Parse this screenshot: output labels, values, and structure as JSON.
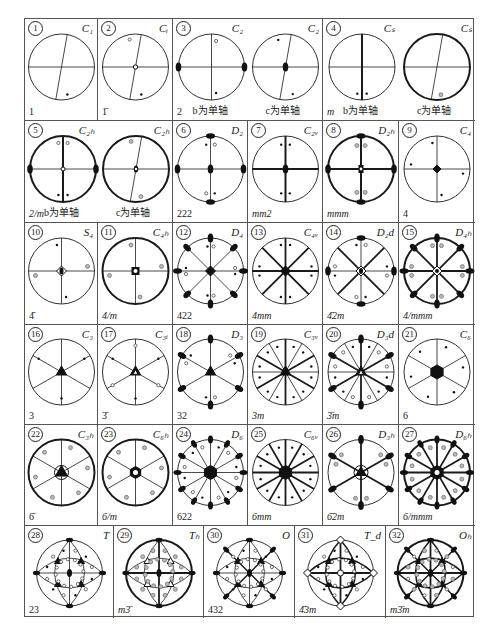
{
  "figure": {
    "axis_caption_b": "b为单轴",
    "axis_caption_c": "c为单轴"
  },
  "point_groups": [
    {
      "index": "1",
      "schoenflies": "C₁",
      "hm": "1"
    },
    {
      "index": "2",
      "schoenflies": "Cᵢ",
      "hm": "1̄"
    },
    {
      "index": "3",
      "schoenflies": "C₂",
      "hm": "2",
      "variants": [
        "b为单轴",
        "c为单轴"
      ]
    },
    {
      "index": "4",
      "schoenflies": "Cₛ",
      "hm": "m",
      "variants": [
        "b为单轴",
        "c为单轴"
      ]
    },
    {
      "index": "5",
      "schoenflies": "C₂ₕ",
      "hm": "2/m",
      "variants": [
        "b为单轴",
        "c为单轴"
      ]
    },
    {
      "index": "6",
      "schoenflies": "D₂",
      "hm": "222"
    },
    {
      "index": "7",
      "schoenflies": "C₂ᵥ",
      "hm": "mm2"
    },
    {
      "index": "8",
      "schoenflies": "D₂ₕ",
      "hm": "mmm"
    },
    {
      "index": "9",
      "schoenflies": "C₄",
      "hm": "4"
    },
    {
      "index": "10",
      "schoenflies": "S₄",
      "hm": "4̄"
    },
    {
      "index": "11",
      "schoenflies": "C₄ₕ",
      "hm": "4/m"
    },
    {
      "index": "12",
      "schoenflies": "D₄",
      "hm": "422"
    },
    {
      "index": "13",
      "schoenflies": "C₄ᵥ",
      "hm": "4mm"
    },
    {
      "index": "14",
      "schoenflies": "D₂d",
      "hm": "4̄2m"
    },
    {
      "index": "15",
      "schoenflies": "D₄ₕ",
      "hm": "4/mmm"
    },
    {
      "index": "16",
      "schoenflies": "C₃",
      "hm": "3"
    },
    {
      "index": "17",
      "schoenflies": "C₃ᵢ",
      "hm": "3̄"
    },
    {
      "index": "18",
      "schoenflies": "D₃",
      "hm": "32"
    },
    {
      "index": "19",
      "schoenflies": "C₃ᵥ",
      "hm": "3m"
    },
    {
      "index": "20",
      "schoenflies": "D₃d",
      "hm": "3̄m"
    },
    {
      "index": "21",
      "schoenflies": "C₆",
      "hm": "6"
    },
    {
      "index": "22",
      "schoenflies": "C₃ₕ",
      "hm": "6̄"
    },
    {
      "index": "23",
      "schoenflies": "C₆ₕ",
      "hm": "6/m"
    },
    {
      "index": "24",
      "schoenflies": "D₆",
      "hm": "622"
    },
    {
      "index": "25",
      "schoenflies": "C₆ᵥ",
      "hm": "6mm"
    },
    {
      "index": "26",
      "schoenflies": "D₃ₕ",
      "hm": "6̄2m"
    },
    {
      "index": "27",
      "schoenflies": "D₆ₕ",
      "hm": "6/mmm"
    },
    {
      "index": "28",
      "schoenflies": "T",
      "hm": "23"
    },
    {
      "index": "29",
      "schoenflies": "Tₕ",
      "hm": "m3̄"
    },
    {
      "index": "30",
      "schoenflies": "O",
      "hm": "432"
    },
    {
      "index": "31",
      "schoenflies": "T_d",
      "hm": "4̄3m"
    },
    {
      "index": "32",
      "schoenflies": "Oₕ",
      "hm": "m3̄m"
    }
  ],
  "colors": {
    "line": "#1a1a1a",
    "border": "#555555",
    "background": "#ffffff",
    "gray_dot": "#888888"
  }
}
